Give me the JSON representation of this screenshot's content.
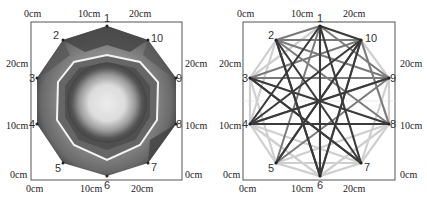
{
  "left_panel": {
    "title": "tomography-image",
    "axis": {
      "top": [
        "0cm",
        "10cm",
        "20cm"
      ],
      "bottom": [
        "0cm",
        "10cm",
        "20cm"
      ],
      "left": [
        "20cm",
        "10cm",
        "0cm"
      ],
      "right": [
        "20cm",
        "10cm",
        "0cm"
      ]
    },
    "nodes": [
      "1",
      "2",
      "3",
      "4",
      "5",
      "6",
      "7",
      "8",
      "9",
      "10"
    ]
  },
  "right_panel": {
    "title": "sensor-network",
    "axis": {
      "top": [
        "0cm",
        "10cm",
        "20cm"
      ],
      "bottom": [
        "0cm",
        "10cm",
        "20cm"
      ],
      "left": [
        "20cm",
        "10cm",
        "0cm"
      ],
      "right": [
        "20cm",
        "10cm",
        "0cm"
      ]
    },
    "nodes": [
      "1",
      "2",
      "3",
      "4",
      "5",
      "6",
      "7",
      "8",
      "9",
      "10"
    ]
  },
  "colors": {
    "frame": "#555555",
    "dark": "#3a3a3a",
    "mid": "#7a7a7a",
    "light": "#cfcfcf"
  }
}
